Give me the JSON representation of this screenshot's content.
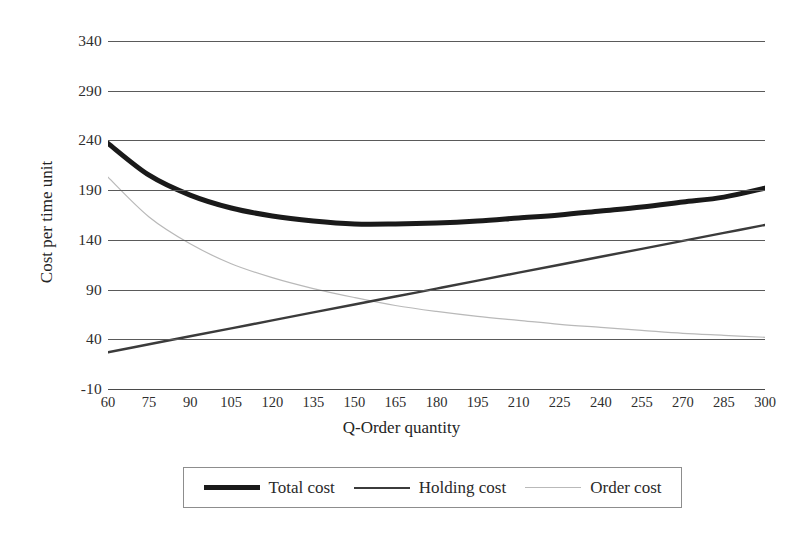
{
  "chart_data": {
    "type": "line",
    "title": "",
    "xlabel": "Q-Order quantity",
    "ylabel": "Cost per time unit",
    "xlim": [
      60,
      300
    ],
    "ylim": [
      -10,
      340
    ],
    "x_ticks": [
      60,
      75,
      90,
      105,
      120,
      135,
      150,
      165,
      180,
      195,
      210,
      225,
      240,
      255,
      270,
      285,
      300
    ],
    "y_ticks": [
      340,
      290,
      240,
      190,
      140,
      90,
      40,
      -10
    ],
    "grid": true,
    "legend_position": "bottom",
    "x": [
      60,
      75,
      90,
      105,
      120,
      135,
      150,
      165,
      180,
      195,
      210,
      225,
      240,
      255,
      270,
      285,
      300
    ],
    "series": [
      {
        "name": "Total cost",
        "color": "#1a1a1a",
        "width": 5,
        "values": [
          237,
          205,
          185,
          172,
          164,
          159,
          156,
          156,
          157,
          159,
          162,
          165,
          169,
          173,
          178,
          183,
          192
        ]
      },
      {
        "name": "Holding cost",
        "color": "#3b3b3b",
        "width": 2.4,
        "values": [
          27,
          35,
          43,
          51,
          59,
          67,
          75,
          83,
          91,
          99,
          107,
          115,
          123,
          131,
          139,
          147,
          155
        ]
      },
      {
        "name": "Order cost",
        "color": "#b9b9b9",
        "width": 1.2,
        "values": [
          203,
          163,
          136,
          116,
          102,
          91,
          82,
          74,
          68,
          63,
          59,
          55,
          52,
          49,
          46,
          44,
          42
        ]
      }
    ]
  },
  "legend": {
    "items": [
      {
        "label": "Total cost",
        "key": "total"
      },
      {
        "label": "Holding cost",
        "key": "holding"
      },
      {
        "label": "Order cost",
        "key": "order"
      }
    ]
  },
  "axes": {
    "x_title": "Q-Order quantity",
    "y_title": "Cost per time unit",
    "y_labels": [
      "340",
      "290",
      "240",
      "190",
      "140",
      "90",
      "40",
      "-10"
    ],
    "x_labels": [
      "60",
      "75",
      "90",
      "105",
      "120",
      "135",
      "150",
      "165",
      "180",
      "195",
      "210",
      "225",
      "240",
      "255",
      "270",
      "285",
      "300"
    ]
  },
  "colors": {
    "grid": "#5a5a5a",
    "axis": "#4a4a4a",
    "total_cost": "#1a1a1a",
    "holding_cost": "#3b3b3b",
    "order_cost": "#b9b9b9",
    "text": "#2e2e2e",
    "background": "#ffffff"
  }
}
